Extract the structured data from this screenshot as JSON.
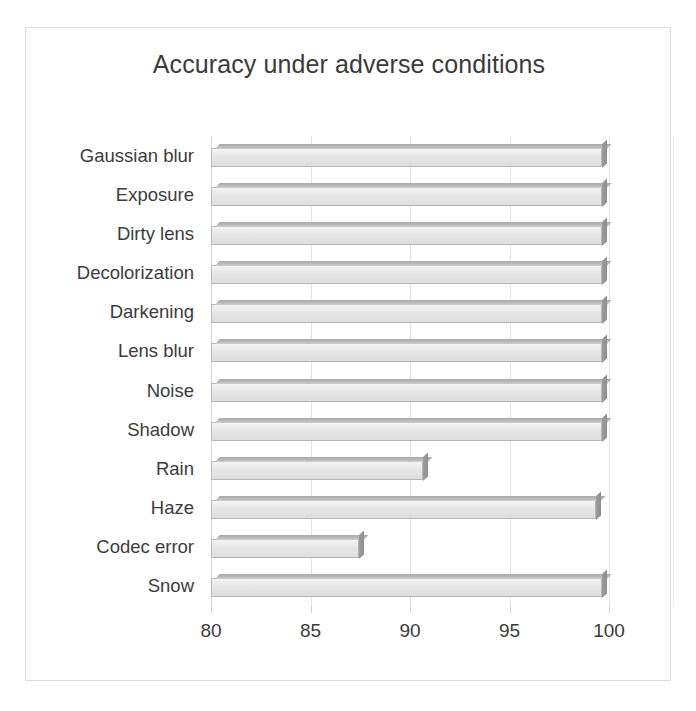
{
  "chart_data": {
    "type": "bar",
    "orientation": "horizontal",
    "title": "Accuracy under adverse conditions",
    "xlabel": "",
    "ylabel": "",
    "xlim": [
      80,
      100
    ],
    "xticks": [
      80,
      85,
      90,
      95,
      100
    ],
    "xtick_labels": [
      "80",
      "85",
      "90",
      "95",
      "100"
    ],
    "grid": true,
    "legend": false,
    "categories": [
      "Gaussian blur",
      "Exposure",
      "Dirty lens",
      "Decolorization",
      "Darkening",
      "Lens blur",
      "Noise",
      "Shadow",
      "Rain",
      "Haze",
      "Codec error",
      "Snow"
    ],
    "values": [
      99.9,
      99.9,
      99.9,
      99.9,
      99.9,
      99.9,
      99.9,
      99.9,
      90.9,
      99.6,
      87.7,
      99.9
    ],
    "bars": [
      {
        "category": "Gaussian blur",
        "value": 99.9
      },
      {
        "category": "Exposure",
        "value": 99.9
      },
      {
        "category": "Dirty lens",
        "value": 99.9
      },
      {
        "category": "Decolorization",
        "value": 99.9
      },
      {
        "category": "Darkening",
        "value": 99.9
      },
      {
        "category": "Lens blur",
        "value": 99.9
      },
      {
        "category": "Noise",
        "value": 99.9
      },
      {
        "category": "Shadow",
        "value": 99.9
      },
      {
        "category": "Rain",
        "value": 90.9
      },
      {
        "category": "Haze",
        "value": 99.6
      },
      {
        "category": "Codec error",
        "value": 87.7
      },
      {
        "category": "Snow",
        "value": 99.9
      }
    ],
    "colors": {
      "bar_face": "#e6e6e6",
      "bar_edge": "#b6b6b6",
      "bar_top": "#bcbcbc",
      "bar_side": "#8e8e8e",
      "gridline": "#e3e3e3",
      "text": "#3c3c3c",
      "frame": "#dcdcdc",
      "background": "#ffffff"
    }
  }
}
